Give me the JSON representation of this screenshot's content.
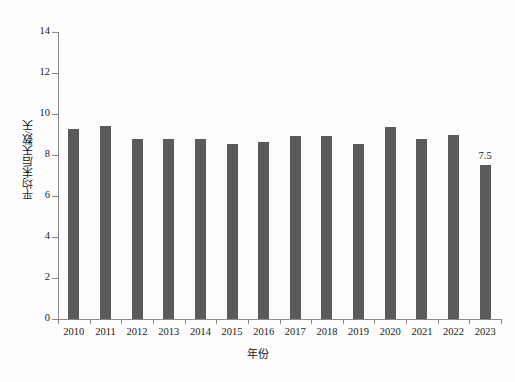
{
  "chart_data": {
    "type": "bar",
    "title": "",
    "xlabel": "年份",
    "ylabel": "平均末后天数/天",
    "categories": [
      "2010",
      "2011",
      "2012",
      "2013",
      "2014",
      "2015",
      "2016",
      "2017",
      "2018",
      "2019",
      "2020",
      "2021",
      "2022",
      "2023"
    ],
    "values": [
      9.25,
      9.4,
      8.8,
      8.8,
      8.8,
      8.55,
      8.65,
      8.95,
      8.95,
      8.55,
      9.35,
      8.8,
      9.0,
      7.5
    ],
    "value_labels": [
      "",
      "",
      "",
      "",
      "",
      "",
      "",
      "",
      "",
      "",
      "",
      "",
      "",
      "7.5"
    ],
    "ylim": [
      0,
      14
    ],
    "yticks": [
      0,
      2,
      4,
      6,
      8,
      10,
      12,
      14
    ],
    "ytick_labels": [
      "0",
      "2",
      "4",
      "6",
      "8",
      "10",
      "12",
      "14"
    ],
    "grid": false,
    "legend": null,
    "bar_color": "#5a5a5a",
    "axis_color": "#8a8a8a",
    "background_color": "#fdfdfd"
  }
}
